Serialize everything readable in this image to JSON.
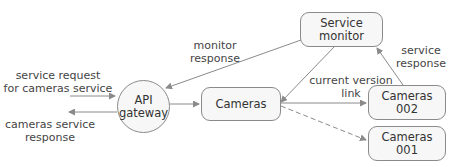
{
  "diagram": {
    "nodes": {
      "service_monitor": {
        "line1": "Service",
        "line2": "monitor"
      },
      "api_gateway": {
        "line1": "API",
        "line2": "gateway"
      },
      "cameras": {
        "label": "Cameras"
      },
      "cameras_002": {
        "line1": "Cameras",
        "line2": "002"
      },
      "cameras_001": {
        "line1": "Cameras",
        "line2": "001"
      }
    },
    "edge_labels": {
      "monitor_response": {
        "line1": "monitor",
        "line2": "response"
      },
      "service_request": {
        "line1": "service request",
        "line2": "for cameras service"
      },
      "cameras_service_response": {
        "line1": "cameras service",
        "line2": "response"
      },
      "current_version_link": {
        "line1": "current version",
        "line2": "link"
      },
      "service_response": {
        "line1": "service",
        "line2": "response"
      }
    },
    "colors": {
      "edge": "#8a8a8a",
      "node_border": "#8a8a8a",
      "node_fill": "#f7f7f7",
      "text": "#333333"
    }
  }
}
